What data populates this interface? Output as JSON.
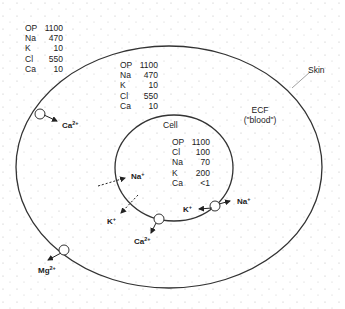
{
  "outside": {
    "table": [
      {
        "label": "OP",
        "value": "1100"
      },
      {
        "label": "Na",
        "value": "470"
      },
      {
        "label": "K",
        "value": "10"
      },
      {
        "label": "Cl",
        "value": "550"
      },
      {
        "label": "Ca",
        "value": "10"
      }
    ]
  },
  "ecf": {
    "table": [
      {
        "label": "OP",
        "value": "1100"
      },
      {
        "label": "Na",
        "value": "470"
      },
      {
        "label": "K",
        "value": "10"
      },
      {
        "label": "Cl",
        "value": "550"
      },
      {
        "label": "Ca",
        "value": "10"
      }
    ],
    "label_line1": "ECF",
    "label_line2": "(\"blood\")"
  },
  "skin_label": "Skin",
  "cell": {
    "label": "Cell",
    "table": [
      {
        "label": "OP",
        "value": "1100"
      },
      {
        "label": "Cl",
        "value": "100"
      },
      {
        "label": "Na",
        "value": "70"
      },
      {
        "label": "K",
        "value": "200"
      },
      {
        "label": "Ca",
        "value": "<1"
      }
    ]
  },
  "ions": {
    "ca_skin": {
      "base": "Ca",
      "charge": "2+"
    },
    "mg_skin": {
      "base": "Mg",
      "charge": "2+"
    },
    "na_in": {
      "base": "Na",
      "charge": "+"
    },
    "k_out": {
      "base": "K",
      "charge": "+"
    },
    "ca_cell": {
      "base": "Ca",
      "charge": "2+"
    },
    "k_pump": {
      "base": "K",
      "charge": "+"
    },
    "na_pump": {
      "base": "Na",
      "charge": "+"
    }
  }
}
